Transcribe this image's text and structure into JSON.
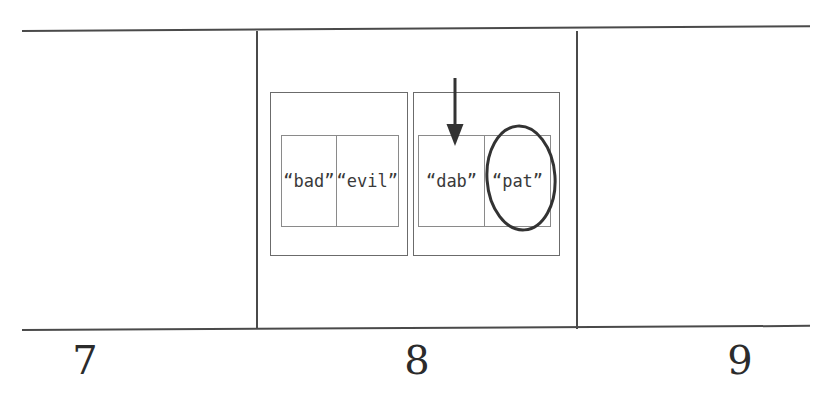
{
  "figure": {
    "background_color": "#ffffff",
    "line_color": "#4a4a4a",
    "box_border_color": "#6b6b6b",
    "inner_border_color": "#8a8a8a",
    "text_color": "#3a3a3a",
    "annotation_color": "#333333"
  },
  "number_line": {
    "labels": [
      {
        "value": "7",
        "left": 55,
        "top": 340
      },
      {
        "value": "8",
        "left": 387,
        "top": 340
      },
      {
        "value": "9",
        "left": 710,
        "top": 340
      }
    ],
    "ticks": [
      {
        "left": 256,
        "top": 31,
        "height": 298
      },
      {
        "left": 576,
        "top": 31,
        "height": 298
      }
    ],
    "rules": [
      {
        "left": 22,
        "top": 30,
        "width": 788,
        "thickness": 1.6,
        "angle": -0.35
      },
      {
        "left": 22,
        "top": 329,
        "width": 788,
        "thickness": 1.6,
        "angle": -0.3
      }
    ]
  },
  "groups": [
    {
      "name": "left-group",
      "outer": {
        "left": 270,
        "top": 92,
        "width": 138,
        "height": 164
      },
      "inner": {
        "left": 281,
        "top": 135,
        "width": 118,
        "height": 92
      },
      "cells": [
        {
          "label": "“bad”"
        },
        {
          "label": "“evil”"
        }
      ]
    },
    {
      "name": "right-group",
      "outer": {
        "left": 413,
        "top": 92,
        "width": 147,
        "height": 164
      },
      "inner": {
        "left": 418,
        "top": 135,
        "width": 133,
        "height": 92
      },
      "cells": [
        {
          "label": "“dab”"
        },
        {
          "label": "“pat”"
        }
      ]
    }
  ],
  "annotations": {
    "arrow": {
      "name": "down-arrow",
      "x": 455,
      "y_start": 78,
      "y_end": 146,
      "stroke_width": 3,
      "head_width": 17,
      "head_length": 22,
      "color": "#333333"
    },
    "ellipse": {
      "name": "highlight-ellipse",
      "cx": 521,
      "cy": 178,
      "rx": 34,
      "ry": 52,
      "rotation": -4,
      "stroke_width": 3,
      "color": "#333333"
    }
  }
}
